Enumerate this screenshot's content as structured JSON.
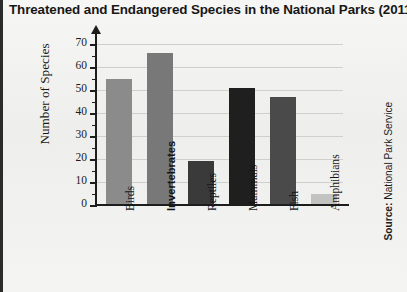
{
  "title": "Threatened and Endangered Species in the National Parks (2011)",
  "source": {
    "prefix": "Source:",
    "name": "National Park Service",
    "full": "Source: National Park Service"
  },
  "axes": {
    "ylabel": "Number of Species",
    "xlabel": "",
    "y_ticks": [
      "0",
      "10",
      "20",
      "30",
      "40",
      "50",
      "60",
      "70"
    ],
    "y_minor_step": 5
  },
  "colors": {
    "background": "#f2f2f0",
    "axis": "#1d1d1d",
    "grid": "#cfcfcb",
    "title": "#171717",
    "bar_birds": "#8b8b8b",
    "bar_invertebrates": "#787878",
    "bar_reptiles": "#3a3a3a",
    "bar_mammals": "#1f1f1f",
    "bar_fish": "#4a4a4a",
    "bar_amphibians": "#c2c2c2"
  },
  "chart_data": {
    "type": "bar",
    "title": "Threatened and Endangered Species in the National Parks (2011)",
    "xlabel": "",
    "ylabel": "Number of Species",
    "ylim": [
      0,
      70
    ],
    "ytick_step": 10,
    "grid": true,
    "legend": "none",
    "categories": [
      "Birds",
      "Invertebrates",
      "Reptiles",
      "Mammals",
      "Fish",
      "Amphibians"
    ],
    "values": [
      55,
      66,
      19,
      51,
      47,
      5
    ],
    "bars": [
      {
        "label": "Birds",
        "value": 55,
        "color": "#8b8b8b",
        "bold_label": false
      },
      {
        "label": "Invertebrates",
        "value": 66,
        "color": "#787878",
        "bold_label": true
      },
      {
        "label": "Reptiles",
        "value": 19,
        "color": "#3a3a3a",
        "bold_label": false
      },
      {
        "label": "Mammals",
        "value": 51,
        "color": "#1f1f1f",
        "bold_label": false
      },
      {
        "label": "Fish",
        "value": 47,
        "color": "#4a4a4a",
        "bold_label": false
      },
      {
        "label": "Amphibians",
        "value": 5,
        "color": "#c2c2c2",
        "bold_label": false
      }
    ]
  }
}
